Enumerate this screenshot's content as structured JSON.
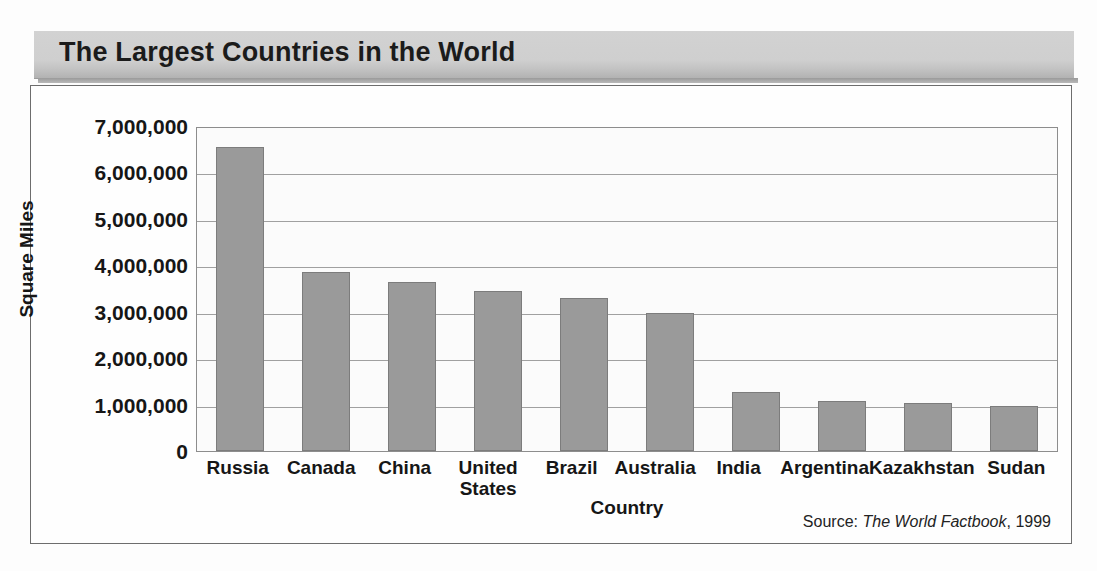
{
  "banner": {
    "title": "The Largest Countries in the World"
  },
  "source": {
    "prefix": "Source:",
    "work": "The World Factbook",
    "year": ", 1999"
  },
  "chart_data": {
    "type": "bar",
    "title": "The Largest Countries in the World",
    "xlabel": "Country",
    "ylabel": "Square Miles",
    "categories": [
      "Russia",
      "Canada",
      "China",
      "United States",
      "Brazil",
      "Australia",
      "India",
      "Argentina",
      "Kazakhstan",
      "Sudan"
    ],
    "category_lines": [
      [
        "Russia"
      ],
      [
        "Canada"
      ],
      [
        "China"
      ],
      [
        "United",
        "States"
      ],
      [
        "Brazil"
      ],
      [
        "Australia"
      ],
      [
        "India"
      ],
      [
        "Argentina"
      ],
      [
        "Kazakhstan"
      ],
      [
        "Sudan"
      ]
    ],
    "values": [
      6550000,
      3850000,
      3640000,
      3450000,
      3290000,
      2970000,
      1270000,
      1070000,
      1040000,
      970000
    ],
    "ylim": [
      0,
      7000000
    ],
    "ytick_values": [
      7000000,
      6000000,
      5000000,
      4000000,
      3000000,
      2000000,
      1000000,
      0
    ],
    "ytick_labels": [
      "7,000,000",
      "6,000,000",
      "5,000,000",
      "4,000,000",
      "3,000,000",
      "2,000,000",
      "1,000,000",
      "0"
    ],
    "grid": true,
    "grid_axis": "y",
    "legend": false,
    "bar_color": "#9a9a9a",
    "bar_border_color": "#7c7c7c",
    "plot_background": "#fbfbfb",
    "text_color": "#161616",
    "banner_color": "#cfcfcf"
  }
}
